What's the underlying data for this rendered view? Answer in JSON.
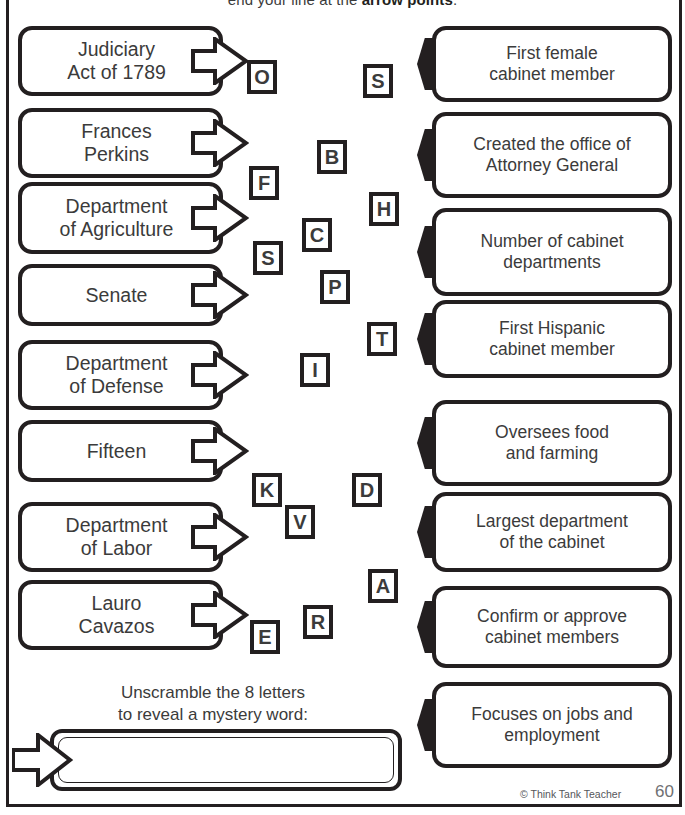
{
  "worksheet": {
    "instruction": "end your line at the ",
    "instruction_bold": "arrow points",
    "instruction_end": ".",
    "unscramble_line1": "Unscramble the 8 letters",
    "unscramble_line2": "to reveal a mystery word:",
    "answer_value": "",
    "credit": "© Think Tank Teacher",
    "page_number": "60"
  },
  "terms": [
    {
      "line1": "Judiciary",
      "line2": "Act of 1789"
    },
    {
      "line1": "Frances",
      "line2": "Perkins"
    },
    {
      "line1": "Department",
      "line2": "of Agriculture"
    },
    {
      "line1": "Senate",
      "line2": ""
    },
    {
      "line1": "Department",
      "line2": "of Defense"
    },
    {
      "line1": "Fifteen",
      "line2": ""
    },
    {
      "line1": "Department",
      "line2": "of Labor"
    },
    {
      "line1": "Lauro",
      "line2": "Cavazos"
    }
  ],
  "clues": [
    {
      "line1": "First female",
      "line2": "cabinet member"
    },
    {
      "line1": "Created the office of",
      "line2": "Attorney General"
    },
    {
      "line1": "Number of cabinet",
      "line2": "departments"
    },
    {
      "line1": "First Hispanic",
      "line2": "cabinet member"
    },
    {
      "line1": "Oversees food",
      "line2": "and farming"
    },
    {
      "line1": "Largest department",
      "line2": "of the cabinet"
    },
    {
      "line1": "Confirm or approve",
      "line2": "cabinet members"
    },
    {
      "line1": "Focuses on jobs and",
      "line2": "employment"
    }
  ],
  "letters": [
    {
      "char": "O",
      "x": 247,
      "y": 60
    },
    {
      "char": "S",
      "x": 363,
      "y": 64
    },
    {
      "char": "B",
      "x": 317,
      "y": 140
    },
    {
      "char": "F",
      "x": 249,
      "y": 166
    },
    {
      "char": "H",
      "x": 369,
      "y": 192
    },
    {
      "char": "C",
      "x": 302,
      "y": 218
    },
    {
      "char": "S",
      "x": 253,
      "y": 241
    },
    {
      "char": "P",
      "x": 320,
      "y": 270
    },
    {
      "char": "T",
      "x": 367,
      "y": 322
    },
    {
      "char": "I",
      "x": 300,
      "y": 353
    },
    {
      "char": "K",
      "x": 252,
      "y": 473
    },
    {
      "char": "D",
      "x": 352,
      "y": 473
    },
    {
      "char": "V",
      "x": 285,
      "y": 505
    },
    {
      "char": "A",
      "x": 368,
      "y": 569
    },
    {
      "char": "R",
      "x": 303,
      "y": 605
    },
    {
      "char": "E",
      "x": 250,
      "y": 620
    }
  ],
  "colors": {
    "ink": "#231f20",
    "text": "#3b3b3b",
    "paper": "#ffffff",
    "credit": "#55565a"
  }
}
